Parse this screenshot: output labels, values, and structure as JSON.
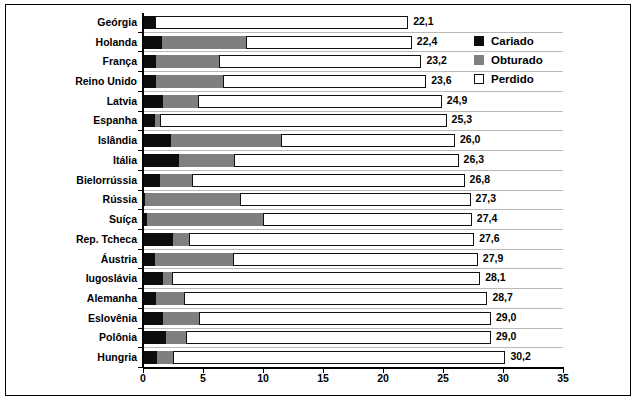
{
  "chart_data": {
    "type": "bar",
    "orientation": "horizontal",
    "stacked": true,
    "title": "",
    "subtitle": "",
    "xlabel": "",
    "ylabel": "",
    "xlim": [
      0,
      35
    ],
    "xticks": [
      0,
      5,
      10,
      15,
      20,
      25,
      30,
      35
    ],
    "xticklabels": [
      "0",
      "5",
      "10",
      "15",
      "20",
      "25",
      "30",
      "35"
    ],
    "grid": true,
    "grid_axis": "y",
    "legend_position": "upper-right-inside",
    "decimal_separator": ",",
    "categories": [
      "Geórgia",
      "Holanda",
      "França",
      "Reino Unido",
      "Latvia",
      "Espanha",
      "Islândia",
      "Itália",
      "Bielorrússia",
      "Rússia",
      "Suíça",
      "Rep. Tcheca",
      "Áustria",
      "Iugoslávia",
      "Alemanha",
      "Eslovênia",
      "Polônia",
      "Hungria"
    ],
    "series": [
      {
        "name": "Cariado",
        "color": "#0d0d0d",
        "values": [
          1.0,
          1.6,
          1.1,
          1.1,
          1.7,
          1.0,
          2.3,
          3.0,
          1.4,
          0.2,
          0.3,
          2.5,
          1.0,
          1.7,
          1.1,
          1.7,
          1.9,
          1.2
        ]
      },
      {
        "name": "Obturado",
        "color": "#7f7f7f",
        "values": [
          0.0,
          7.0,
          5.2,
          5.6,
          2.9,
          0.4,
          9.2,
          4.6,
          2.7,
          7.9,
          9.7,
          1.3,
          6.5,
          0.7,
          2.3,
          3.0,
          1.7,
          1.3
        ]
      },
      {
        "name": "Perdido",
        "color": "#ffffff",
        "values": [
          21.1,
          13.8,
          16.9,
          16.9,
          20.3,
          23.9,
          14.5,
          18.7,
          22.7,
          19.2,
          17.4,
          23.8,
          20.4,
          25.7,
          25.3,
          24.3,
          25.4,
          27.7
        ]
      }
    ],
    "totals": [
      22.1,
      22.4,
      23.2,
      23.6,
      24.9,
      25.3,
      26.0,
      26.3,
      26.8,
      27.3,
      27.4,
      27.6,
      27.9,
      28.1,
      28.7,
      29.0,
      29.0,
      30.2
    ],
    "total_labels": [
      "22,1",
      "22,4",
      "23,2",
      "23,6",
      "24,9",
      "25,3",
      "26,0",
      "26,3",
      "26,8",
      "27,3",
      "27,4",
      "27,6",
      "27,9",
      "28,1",
      "28,7",
      "29,0",
      "29,0",
      "30,2"
    ]
  },
  "legend": {
    "items": [
      {
        "label": "Cariado",
        "swatch": "cariado"
      },
      {
        "label": "Obturado",
        "swatch": "obturado"
      },
      {
        "label": "Perdido",
        "swatch": "perdido"
      }
    ]
  }
}
